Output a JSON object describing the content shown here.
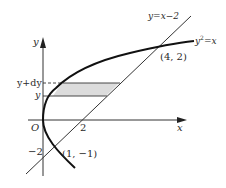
{
  "diagram": {
    "type": "area-between-curves",
    "axes": {
      "x_label": "x",
      "y_label": "y",
      "origin_label": "O"
    },
    "ticks": {
      "x_tick": "2",
      "y_tick": "−2"
    },
    "curves": {
      "line_label": "y=x−2",
      "parabola_label_base": "y",
      "parabola_label_exp": "2",
      "parabola_label_rest": "=x"
    },
    "points": {
      "upper_intersection": "(4, 2)",
      "lower_intersection": "(1, −1)"
    },
    "strip": {
      "top_label": "y+dy",
      "bottom_label": "y",
      "fill_color": "#dcdcdc"
    },
    "colors": {
      "stroke": "#222222",
      "background": "#ffffff"
    }
  }
}
